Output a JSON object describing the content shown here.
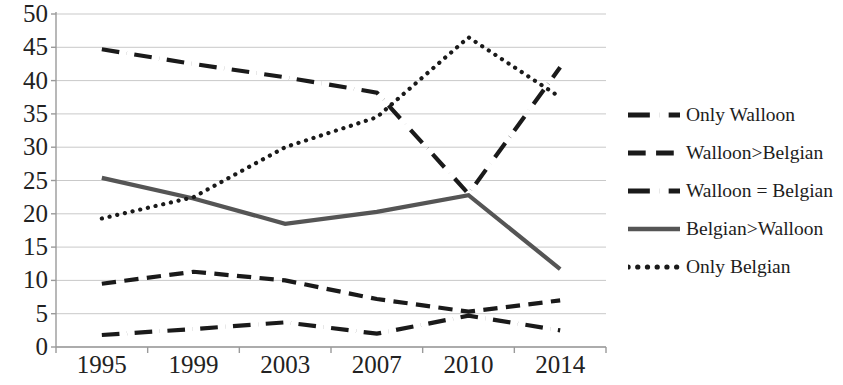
{
  "chart_data": {
    "type": "line",
    "title": "",
    "xlabel": "",
    "ylabel": "",
    "categories": [
      "1995",
      "1999",
      "2003",
      "2007",
      "2010",
      "2014"
    ],
    "ylim": [
      0,
      50
    ],
    "y_ticks": [
      0,
      5,
      10,
      15,
      20,
      25,
      30,
      35,
      40,
      45,
      50
    ],
    "grid": true,
    "legend_position": "right",
    "series": [
      {
        "name": "Only Walloon",
        "style": "dash-dot",
        "color": "#1a1a1a",
        "width": 4.2,
        "values": [
          44.7,
          42.5,
          40.5,
          38.2,
          23.0,
          42.0
        ]
      },
      {
        "name": "Walloon>Belgian",
        "style": "dashed",
        "color": "#1a1a1a",
        "width": 4.2,
        "values": [
          9.5,
          11.3,
          10.0,
          7.2,
          5.3,
          7.0
        ]
      },
      {
        "name": "Walloon = Belgian",
        "style": "dash-dot",
        "color": "#1a1a1a",
        "width": 4.2,
        "values": [
          1.8,
          2.7,
          3.7,
          2.0,
          4.7,
          2.5
        ]
      },
      {
        "name": "Belgian>Walloon",
        "style": "solid",
        "color": "#555555",
        "width": 4.2,
        "values": [
          25.4,
          22.3,
          18.5,
          20.3,
          22.8,
          11.7
        ]
      },
      {
        "name": "Only Belgian",
        "style": "dotted",
        "color": "#1a1a1a",
        "width": 4.2,
        "values": [
          19.3,
          22.5,
          30.0,
          34.5,
          46.5,
          37.5
        ]
      }
    ]
  },
  "axes": {
    "y_tick_labels": [
      "50",
      "45",
      "40",
      "35",
      "30",
      "25",
      "20",
      "15",
      "10",
      "5",
      "0"
    ],
    "x_tick_labels": [
      "1995",
      "1999",
      "2003",
      "2007",
      "2010",
      "2014"
    ]
  },
  "legend": {
    "items": [
      {
        "label": "Only Walloon"
      },
      {
        "label": "Walloon>Belgian"
      },
      {
        "label": "Walloon = Belgian"
      },
      {
        "label": "Belgian>Walloon"
      },
      {
        "label": "Only Belgian"
      }
    ]
  }
}
